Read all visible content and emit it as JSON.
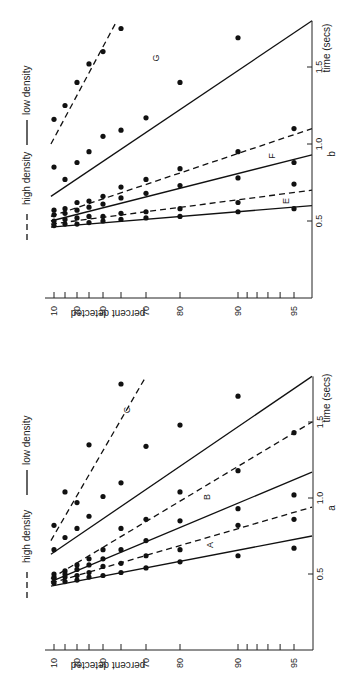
{
  "figure": {
    "orientation_note": "figure printed rotated 90 degrees counter-clockwise",
    "legend": {
      "high": "high density",
      "low": "low density"
    }
  },
  "chart_data": [
    {
      "panel": "b",
      "type": "scatter",
      "title": "b",
      "xlabel": "percent detected",
      "ylabel": "time (secs)",
      "x_scale": "probit",
      "x_ticks": [
        10,
        20,
        30,
        40,
        50,
        60,
        70,
        80,
        90,
        91,
        92,
        93,
        94,
        95
      ],
      "x_tick_labels": [
        "10",
        "30",
        "50",
        "70",
        "80",
        "90",
        "95"
      ],
      "y_ticks": [
        0.5,
        1.0,
        1.5
      ],
      "y_tick_labels": [
        "0.5",
        "1.0",
        "1.5"
      ],
      "ylim": [
        0,
        1.8
      ],
      "xlim": [
        5,
        97
      ],
      "legend": {
        "placement": "left",
        "entries": [
          "high density",
          "low density"
        ]
      },
      "series": [
        {
          "name": "G",
          "style": "dashed",
          "label": "",
          "line": [
            [
              8,
              1.0
            ],
            [
              60,
              1.85
            ]
          ],
          "points": [
            [
              10,
              1.16
            ],
            [
              20,
              1.25
            ],
            [
              30,
              1.4
            ],
            [
              40,
              1.52
            ],
            [
              50,
              1.6
            ],
            [
              60,
              1.75
            ]
          ]
        },
        {
          "name": "G",
          "style": "solid",
          "label": "G",
          "line": [
            [
              8,
              0.66
            ],
            [
              97,
              1.8
            ]
          ],
          "points": [
            [
              10,
              0.85
            ],
            [
              20,
              0.77
            ],
            [
              30,
              0.88
            ],
            [
              40,
              0.95
            ],
            [
              50,
              1.05
            ],
            [
              60,
              1.09
            ],
            [
              70,
              1.17
            ],
            [
              80,
              1.4
            ],
            [
              90,
              1.69
            ]
          ]
        },
        {
          "name": "F",
          "style": "dashed",
          "label": "F",
          "line": [
            [
              8,
              0.53
            ],
            [
              97,
              1.1
            ]
          ],
          "points": [
            [
              10,
              0.57
            ],
            [
              20,
              0.58
            ],
            [
              30,
              0.62
            ],
            [
              40,
              0.63
            ],
            [
              50,
              0.66
            ],
            [
              60,
              0.72
            ],
            [
              70,
              0.77
            ],
            [
              80,
              0.84
            ],
            [
              90,
              0.95
            ],
            [
              95,
              1.1
            ]
          ]
        },
        {
          "name": "F",
          "style": "solid",
          "label": "",
          "line": [
            [
              8,
              0.5
            ],
            [
              97,
              0.93
            ]
          ],
          "points": [
            [
              10,
              0.54
            ],
            [
              20,
              0.55
            ],
            [
              30,
              0.57
            ],
            [
              40,
              0.59
            ],
            [
              50,
              0.61
            ],
            [
              60,
              0.65
            ],
            [
              70,
              0.68
            ],
            [
              80,
              0.73
            ],
            [
              90,
              0.78
            ],
            [
              95,
              0.88
            ]
          ]
        },
        {
          "name": "E",
          "style": "dashed",
          "label": "E",
          "line": [
            [
              8,
              0.48
            ],
            [
              97,
              0.7
            ]
          ],
          "points": [
            [
              10,
              0.5
            ],
            [
              20,
              0.51
            ],
            [
              30,
              0.52
            ],
            [
              40,
              0.53
            ],
            [
              50,
              0.53
            ],
            [
              60,
              0.55
            ],
            [
              70,
              0.56
            ],
            [
              80,
              0.58
            ],
            [
              90,
              0.62
            ],
            [
              95,
              0.74
            ]
          ]
        },
        {
          "name": "E",
          "style": "solid",
          "label": "",
          "line": [
            [
              8,
              0.46
            ],
            [
              97,
              0.6
            ]
          ],
          "points": [
            [
              10,
              0.47
            ],
            [
              20,
              0.48
            ],
            [
              30,
              0.48
            ],
            [
              40,
              0.49
            ],
            [
              50,
              0.5
            ],
            [
              60,
              0.51
            ],
            [
              70,
              0.52
            ],
            [
              80,
              0.53
            ],
            [
              90,
              0.56
            ],
            [
              95,
              0.58
            ]
          ]
        }
      ]
    },
    {
      "panel": "a",
      "type": "scatter",
      "title": "a",
      "xlabel": "percent detected",
      "ylabel": "time (secs)",
      "x_scale": "probit",
      "x_ticks": [
        10,
        20,
        30,
        40,
        50,
        60,
        70,
        80,
        90,
        91,
        92,
        93,
        94,
        95
      ],
      "x_tick_labels": [
        "10",
        "30",
        "50",
        "70",
        "80",
        "90",
        "95"
      ],
      "y_ticks": [
        0.5,
        1.0,
        1.5
      ],
      "y_tick_labels": [
        "0.5",
        "1.0",
        "1.5"
      ],
      "ylim": [
        0,
        1.8
      ],
      "xlim": [
        5,
        97
      ],
      "legend": {
        "placement": "left",
        "entries": [
          "high density",
          "low density"
        ]
      },
      "series": [
        {
          "name": "C",
          "style": "dashed",
          "label": "",
          "line": [
            [
              8,
              0.72
            ],
            [
              70,
              1.8
            ]
          ],
          "points": [
            [
              10,
              0.82
            ],
            [
              20,
              1.04
            ],
            [
              30,
              0.97
            ],
            [
              40,
              1.35
            ],
            [
              60,
              1.75
            ]
          ]
        },
        {
          "name": "C",
          "style": "solid",
          "label": "C",
          "line": [
            [
              8,
              0.63
            ],
            [
              97,
              1.8
            ]
          ],
          "points": [
            [
              10,
              0.66
            ],
            [
              20,
              0.74
            ],
            [
              30,
              0.8
            ],
            [
              40,
              0.88
            ],
            [
              50,
              1.01
            ],
            [
              60,
              1.1
            ],
            [
              70,
              1.34
            ],
            [
              80,
              1.48
            ],
            [
              90,
              1.67
            ]
          ]
        },
        {
          "name": "B",
          "style": "dashed",
          "label": "B",
          "line": [
            [
              8,
              0.47
            ],
            [
              97,
              1.5
            ]
          ],
          "points": [
            [
              10,
              0.5
            ],
            [
              20,
              0.52
            ],
            [
              30,
              0.56
            ],
            [
              40,
              0.6
            ],
            [
              50,
              0.66
            ],
            [
              60,
              0.8
            ],
            [
              70,
              0.86
            ],
            [
              80,
              1.04
            ],
            [
              90,
              1.18
            ],
            [
              95,
              1.43
            ]
          ]
        },
        {
          "name": "B",
          "style": "solid",
          "label": "",
          "line": [
            [
              8,
              0.45
            ],
            [
              97,
              1.17
            ]
          ],
          "points": [
            [
              10,
              0.48
            ],
            [
              20,
              0.5
            ],
            [
              30,
              0.53
            ],
            [
              40,
              0.56
            ],
            [
              50,
              0.6
            ],
            [
              60,
              0.66
            ],
            [
              70,
              0.72
            ],
            [
              80,
              0.85
            ],
            [
              90,
              0.93
            ],
            [
              95,
              1.02
            ]
          ]
        },
        {
          "name": "A",
          "style": "dashed",
          "label": "A",
          "line": [
            [
              8,
              0.44
            ],
            [
              97,
              0.94
            ]
          ],
          "points": [
            [
              10,
              0.47
            ],
            [
              20,
              0.48
            ],
            [
              30,
              0.49
            ],
            [
              40,
              0.51
            ],
            [
              50,
              0.55
            ],
            [
              60,
              0.57
            ],
            [
              70,
              0.62
            ],
            [
              80,
              0.66
            ],
            [
              90,
              0.82
            ],
            [
              95,
              0.86
            ]
          ]
        },
        {
          "name": "A",
          "style": "solid",
          "label": "",
          "line": [
            [
              8,
              0.42
            ],
            [
              97,
              0.75
            ]
          ],
          "points": [
            [
              10,
              0.44
            ],
            [
              20,
              0.45
            ],
            [
              30,
              0.46
            ],
            [
              40,
              0.48
            ],
            [
              50,
              0.49
            ],
            [
              60,
              0.51
            ],
            [
              70,
              0.54
            ],
            [
              80,
              0.58
            ],
            [
              90,
              0.62
            ],
            [
              95,
              0.67
            ]
          ]
        }
      ]
    }
  ]
}
